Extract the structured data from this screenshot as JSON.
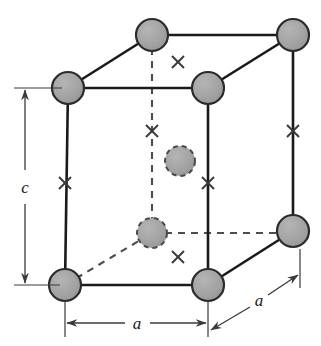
{
  "figure": {
    "background_color": "#ffffff",
    "width": 321,
    "height": 346
  },
  "style": {
    "atom_fill": "#a0a0a0",
    "atom_stroke": "#2b2b2b",
    "edge_color": "#1a1a1a",
    "dashed_color": "#4d4d4d",
    "dimension_color": "#3a3a3a",
    "cross_color": "#3a3a3a",
    "atom_radius": 16,
    "interior_atom_radius": 15
  },
  "labels": {
    "lattice_a_bottom": "a",
    "lattice_a_depth": "a",
    "lattice_c": "c"
  },
  "dimensions": [
    {
      "name": "a-bottom",
      "label": "a",
      "orientation": "horizontal",
      "from": [
        65,
        323
      ],
      "to": [
        208,
        323
      ]
    },
    {
      "name": "a-depth",
      "label": "a",
      "orientation": "diagonal",
      "from": [
        212,
        330
      ],
      "to": [
        296,
        273
      ]
    },
    {
      "name": "c-vertical",
      "label": "c",
      "orientation": "vertical",
      "from": [
        25,
        88
      ],
      "to": [
        25,
        285
      ]
    }
  ],
  "atoms": [
    {
      "name": "corner-back-top-left",
      "cx": 68,
      "cy": 88,
      "r": 16,
      "style": "solid"
    },
    {
      "name": "corner-back-top-right",
      "cx": 152,
      "cy": 35,
      "r": 16,
      "style": "solid"
    },
    {
      "name": "corner-far-top-right",
      "cx": 293,
      "cy": 35,
      "r": 16,
      "style": "solid"
    },
    {
      "name": "corner-front-top-right",
      "cx": 208,
      "cy": 88,
      "r": 16,
      "style": "solid"
    },
    {
      "name": "corner-front-bottom-left",
      "cx": 65,
      "cy": 285,
      "r": 16,
      "style": "solid"
    },
    {
      "name": "corner-front-bottom-right",
      "cx": 208,
      "cy": 285,
      "r": 16,
      "style": "solid"
    },
    {
      "name": "corner-far-bottom-right",
      "cx": 293,
      "cy": 231,
      "r": 16,
      "style": "solid"
    },
    {
      "name": "interior-atom-upper",
      "cx": 180,
      "cy": 161,
      "r": 15,
      "style": "dashed"
    },
    {
      "name": "interior-atom-lower",
      "cx": 152,
      "cy": 233,
      "r": 15,
      "style": "dashed"
    }
  ],
  "cross_marks": [
    {
      "name": "cross-top-face",
      "x": 178,
      "y": 62
    },
    {
      "name": "cross-back-edge",
      "x": 152,
      "y": 131
    },
    {
      "name": "cross-right-edge",
      "x": 293,
      "y": 131
    },
    {
      "name": "cross-left-edge",
      "x": 65,
      "y": 183
    },
    {
      "name": "cross-front-right-edge",
      "x": 208,
      "y": 183
    },
    {
      "name": "cross-bottom-face",
      "x": 178,
      "y": 257
    }
  ],
  "edges": {
    "solid": [
      {
        "name": "edge-top-back-left",
        "from": [
          68,
          88
        ],
        "to": [
          152,
          35
        ]
      },
      {
        "name": "edge-top-back",
        "from": [
          152,
          35
        ],
        "to": [
          293,
          35
        ]
      },
      {
        "name": "edge-top-front-right",
        "from": [
          208,
          88
        ],
        "to": [
          293,
          35
        ]
      },
      {
        "name": "edge-top-front",
        "from": [
          68,
          88
        ],
        "to": [
          208,
          88
        ]
      },
      {
        "name": "edge-left-vertical",
        "from": [
          68,
          88
        ],
        "to": [
          65,
          285
        ]
      },
      {
        "name": "edge-front-right-vertical",
        "from": [
          208,
          88
        ],
        "to": [
          208,
          285
        ]
      },
      {
        "name": "edge-far-right-vertical",
        "from": [
          293,
          35
        ],
        "to": [
          293,
          231
        ]
      },
      {
        "name": "edge-bottom-front",
        "from": [
          65,
          285
        ],
        "to": [
          208,
          285
        ]
      },
      {
        "name": "edge-bottom-front-right",
        "from": [
          208,
          285
        ],
        "to": [
          293,
          231
        ]
      }
    ],
    "dashed": [
      {
        "name": "edge-back-vertical-hidden",
        "from": [
          152,
          35
        ],
        "to": [
          152,
          233
        ]
      },
      {
        "name": "edge-bottom-back-left-hidden",
        "from": [
          65,
          285
        ],
        "to": [
          152,
          233
        ]
      },
      {
        "name": "edge-bottom-back-hidden",
        "from": [
          152,
          233
        ],
        "to": [
          293,
          233
        ]
      }
    ]
  }
}
